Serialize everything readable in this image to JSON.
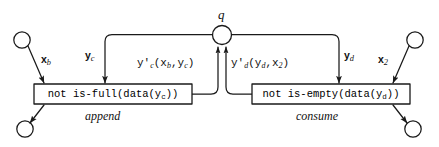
{
  "diagram": {
    "type": "petri-net-dataflow",
    "title": "",
    "place": {
      "id": "q",
      "label": "q",
      "shape": "circle"
    },
    "transitions": [
      {
        "id": "append",
        "name": "append",
        "guard": "not is-full(data(y",
        "guard_sub": "c",
        "guard_tail": "))",
        "guard_full": "not is-full(data(y_c))"
      },
      {
        "id": "consume",
        "name": "consume",
        "guard": "not is-empty(data(y",
        "guard_sub": "d",
        "guard_tail": "))",
        "guard_full": "not is-empty(data(y_d))"
      }
    ],
    "ports": [
      {
        "id": "in-left",
        "kind": "input",
        "label": "x",
        "label_sub": "b",
        "label_full": "x_b"
      },
      {
        "id": "in-right",
        "kind": "input",
        "label": "x",
        "label_sub": "2",
        "label_full": "x_2"
      },
      {
        "id": "out-left",
        "kind": "output",
        "label": "",
        "label_sub": "",
        "label_full": ""
      },
      {
        "id": "out-right",
        "kind": "output",
        "label": "",
        "label_sub": "",
        "label_full": ""
      }
    ],
    "arcs": [
      {
        "id": "q-to-append",
        "label": "y",
        "label_sub": "c",
        "label_full": "y_c",
        "from": "q",
        "to": "append"
      },
      {
        "id": "q-to-consume",
        "label": "y",
        "label_sub": "d",
        "label_full": "y_d",
        "from": "q",
        "to": "consume"
      },
      {
        "id": "append-to-q",
        "label": "y'",
        "label_sub": "c",
        "args": "(x_b,y_c)",
        "label_full": "y'_c(x_b,y_c)",
        "from": "append",
        "to": "q"
      },
      {
        "id": "consume-to-q",
        "label": "y'",
        "label_sub": "d",
        "args": "(y_d,x_2)",
        "label_full": "y'_d(y_d,x_2)",
        "from": "consume",
        "to": "q"
      }
    ],
    "colors": {
      "stroke": "#1a1a1a",
      "fill": "#ffffff",
      "text": "#000000"
    }
  },
  "labels": {
    "q": "q",
    "append": "append",
    "consume": "consume",
    "box_left_a": "not is-full(data(y",
    "box_left_sub": "c",
    "box_left_b": "))",
    "box_right_a": "not is-empty(data(y",
    "box_right_sub": "d",
    "box_right_b": "))",
    "yc_main": "y",
    "yc_sub": "c",
    "yd_main": "y",
    "yd_sub": "d",
    "xb_main": "x",
    "xb_sub": "b",
    "x2_main": "x",
    "x2_sub": "2",
    "ypc_main": "y'",
    "ypc_sub": "c",
    "ypc_args": "(x",
    "ypc_args_sub": "b",
    "ypc_args_mid": ",y",
    "ypc_args_sub2": "c",
    "ypc_args_end": ")",
    "ypd_main": "y'",
    "ypd_sub": "d",
    "ypd_args": "(y",
    "ypd_args_sub": "d",
    "ypd_args_mid": ",x",
    "ypd_args_sub2": "2",
    "ypd_args_end": ")"
  }
}
